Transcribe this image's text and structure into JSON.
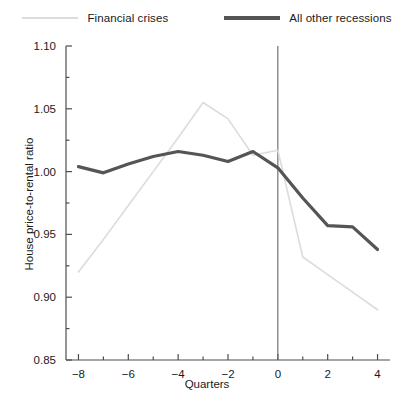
{
  "chart_data": {
    "type": "line",
    "title": "",
    "xlabel": "Quarters",
    "ylabel": "House price-to-rental ratio",
    "xlim": [
      -8.5,
      4.5
    ],
    "ylim": [
      0.85,
      1.1
    ],
    "x": [
      -8,
      -7,
      -6,
      -5,
      -4,
      -3,
      -2,
      -1,
      0,
      1,
      2,
      3,
      4
    ],
    "xticks": [
      -8,
      -6,
      -4,
      -2,
      0,
      2,
      4
    ],
    "xtick_labels": [
      "−8",
      "−6",
      "−4",
      "−2",
      "0",
      "2",
      "4"
    ],
    "xminor_step": 1,
    "yticks": [
      0.85,
      0.9,
      0.95,
      1.0,
      1.05,
      1.1
    ],
    "ytick_labels": [
      "0.85",
      "0.90",
      "0.95",
      "1.00",
      "1.05",
      "1.10"
    ],
    "yminor_step": 0.025,
    "grid": false,
    "legend_position": "top-center",
    "vertical_reference_line": 0,
    "series": [
      {
        "name": "Financial crises",
        "color": "#dcdcdc",
        "linewidth": 1.6,
        "values": [
          0.92,
          0.946,
          0.973,
          1.0,
          1.027,
          1.055,
          1.042,
          1.013,
          1.017,
          0.932,
          0.918,
          0.904,
          0.89
        ]
      },
      {
        "name": "All other recessions",
        "color": "#555555",
        "linewidth": 3.2,
        "values": [
          1.004,
          0.999,
          1.006,
          1.012,
          1.016,
          1.013,
          1.008,
          1.016,
          1.003,
          0.979,
          0.957,
          0.956,
          0.938
        ]
      }
    ]
  },
  "legend": {
    "items": [
      {
        "label": "Financial crises",
        "color": "#dcdcdc",
        "weight": "thin"
      },
      {
        "label": "All other recessions",
        "color": "#555555",
        "weight": "thick"
      }
    ]
  },
  "axes": {
    "x_title": "Quarters",
    "y_title": "House price-to-rental ratio"
  },
  "colors": {
    "axis": "#4d4d4d",
    "text": "#1a1a1a",
    "background": "#ffffff"
  }
}
